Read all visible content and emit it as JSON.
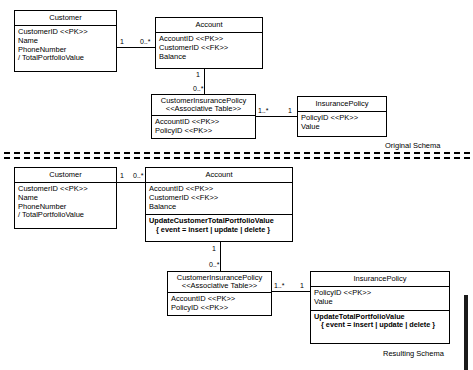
{
  "diagram": {
    "title_top": "Original Schema",
    "title_bottom": "Resulting Schema",
    "stereotypes": {
      "pk": "<<PK>>",
      "fk": "<<FK>>",
      "associative": "<<Associative Table>>"
    },
    "multiplicities": {
      "one": "1",
      "zero_many": "0..*",
      "one_many": "1..*"
    }
  },
  "original_schema": {
    "label": "Original Schema",
    "classes": {
      "customer": {
        "name": "Customer",
        "attributes": [
          "CustomerID <<PK>>",
          "Name",
          "PhoneNumber",
          "/ TotalPortfolioValue"
        ]
      },
      "account": {
        "name": "Account",
        "attributes": [
          "AccountID <<PK>>",
          "CustomerID <<FK>>",
          "Balance"
        ]
      },
      "customer_insurance_policy": {
        "name": "CustomerInsurancePolicy",
        "stereotype": "<<Associative Table>>",
        "attributes": [
          "AccountID <<PK>>",
          "PolicyID <<PK>>"
        ]
      },
      "insurance_policy": {
        "name": "InsurancePolicy",
        "attributes": [
          "PolicyID <<PK>>",
          "Value"
        ]
      }
    },
    "associations": [
      {
        "from": "Customer",
        "to": "Account",
        "from_mult": "1",
        "to_mult": "0..*"
      },
      {
        "from": "Account",
        "to": "CustomerInsurancePolicy",
        "from_mult": "1",
        "to_mult": "0..*"
      },
      {
        "from": "CustomerInsurancePolicy",
        "to": "InsurancePolicy",
        "from_mult": "1..*",
        "to_mult": "1"
      }
    ]
  },
  "resulting_schema": {
    "label": "Resulting Schema",
    "classes": {
      "customer": {
        "name": "Customer",
        "attributes": [
          "CustomerID <<PK>>",
          "Name",
          "PhoneNumber",
          "/ TotalPortfolioValue"
        ]
      },
      "account": {
        "name": "Account",
        "attributes": [
          "AccountID <<PK>>",
          "CustomerID <<FK>>",
          "Balance"
        ],
        "operations": [
          "UpdateCustomerTotalPortfolioValue",
          "{ event = insert | update | delete }"
        ]
      },
      "customer_insurance_policy": {
        "name": "CustomerInsurancePolicy",
        "stereotype": "<<Associative Table>>",
        "attributes": [
          "AccountID <<PK>>",
          "PolicyID <<PK>>"
        ]
      },
      "insurance_policy": {
        "name": "InsurancePolicy",
        "attributes": [
          "PolicyID <<PK>>",
          "Value"
        ],
        "operations": [
          "UpdateTotalPortfolioValue",
          "{ event = insert | update | delete }"
        ]
      }
    },
    "associations": [
      {
        "from": "Customer",
        "to": "Account",
        "from_mult": "1",
        "to_mult": "0..*"
      },
      {
        "from": "Account",
        "to": "CustomerInsurancePolicy",
        "from_mult": "1",
        "to_mult": "0..*"
      },
      {
        "from": "CustomerInsurancePolicy",
        "to": "InsurancePolicy",
        "from_mult": "1..*",
        "to_mult": "1"
      }
    ]
  }
}
